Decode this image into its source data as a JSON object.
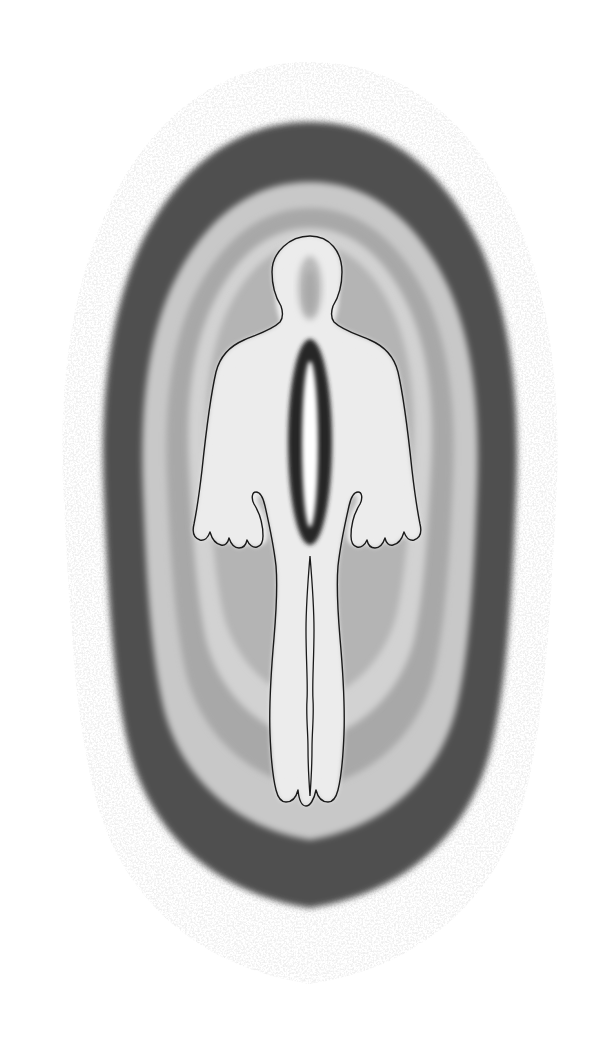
{
  "document": {
    "title": "Isodose field distribution around human body",
    "background_color": "#ffffff",
    "width": 598,
    "height": 1037
  },
  "figure": {
    "name": "concentric-field-distribution-diagram",
    "orientation": "frontal-anterior",
    "symmetry": "bilateral-vertical",
    "body_outline_color": "#1a1a1a",
    "body_outline_width": "1.4"
  },
  "layers": [
    {
      "index": 0,
      "name": "outer-stipple-halo",
      "label": "Outermost stippled halo",
      "color": "#dcdcdc",
      "texture": "stipple",
      "relative_level": "lowest"
    },
    {
      "index": 1,
      "name": "dark-band",
      "label": "Dark isodose band",
      "color": "#4f4f4f",
      "texture": "solid",
      "relative_level": "low"
    },
    {
      "index": 2,
      "name": "light-gray-band",
      "label": "Light gray isodose band",
      "color": "#c8c8c8",
      "texture": "solid",
      "relative_level": "low-mid"
    },
    {
      "index": 3,
      "name": "mid-gray-band",
      "label": "Mid gray isodose band",
      "color": "#a8a8a8",
      "texture": "solid",
      "relative_level": "mid"
    },
    {
      "index": 4,
      "name": "pale-band",
      "label": "Pale isodose band",
      "color": "#d2d2d2",
      "texture": "solid",
      "relative_level": "mid-high"
    },
    {
      "index": 5,
      "name": "near-body-gray-band",
      "label": "Near-body gray band",
      "color": "#b4b4b4",
      "texture": "solid",
      "relative_level": "high"
    },
    {
      "index": 6,
      "name": "body-interior-light",
      "label": "Body interior light field",
      "color": "#ececec",
      "texture": "solid",
      "relative_level": "high"
    },
    {
      "index": 7,
      "name": "hotspot-dark-ring",
      "label": "Central hotspot dark ring",
      "color": "#262626",
      "texture": "solid",
      "relative_level": "peak-shell"
    },
    {
      "index": 8,
      "name": "hotspot-core",
      "label": "Central hotspot bright core",
      "color": "#ffffff",
      "texture": "solid",
      "relative_level": "peak"
    }
  ],
  "chart_data": {
    "type": "heatmap",
    "title": "Isodose field distribution around human body",
    "xlabel": "",
    "ylabel": "",
    "legend_position": "none",
    "grid": false,
    "contour_levels": [
      {
        "name": "outer-stipple-halo",
        "color": "#dcdcdc",
        "value": 1
      },
      {
        "name": "dark-band",
        "color": "#4f4f4f",
        "value": 2
      },
      {
        "name": "light-gray-band",
        "color": "#c8c8c8",
        "value": 3
      },
      {
        "name": "mid-gray-band",
        "color": "#a8a8a8",
        "value": 4
      },
      {
        "name": "pale-band",
        "color": "#d2d2d2",
        "value": 5
      },
      {
        "name": "near-body-gray-band",
        "color": "#b4b4b4",
        "value": 6
      },
      {
        "name": "body-interior-light",
        "color": "#ececec",
        "value": 7
      },
      {
        "name": "hotspot-dark-ring",
        "color": "#262626",
        "value": 8
      },
      {
        "name": "hotspot-core",
        "color": "#ffffff",
        "value": 9
      }
    ],
    "hotspot": {
      "center_x": 310,
      "center_y": 442,
      "ring_rx": 22,
      "ring_ry": 103,
      "core_rx": 8,
      "core_ry": 83
    },
    "figure_extent": {
      "x_min": 58,
      "x_max": 560,
      "y_min": 62,
      "y_max": 990
    }
  }
}
